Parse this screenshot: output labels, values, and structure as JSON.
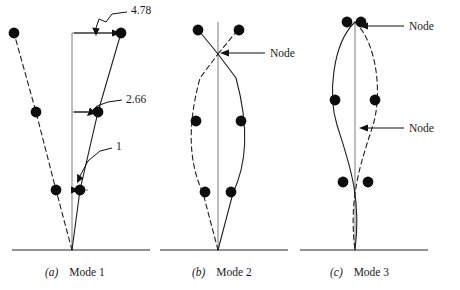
{
  "figure": {
    "type": "engineering-diagram",
    "panels": [
      {
        "id": "a",
        "letter": "(a)",
        "label": "Mode 1",
        "caption": "(a)   Mode 1",
        "amplitudes": [
          "1",
          "2.66",
          "4.78"
        ],
        "annotations": [
          {
            "name": "top-amplitude",
            "text": "4.78"
          },
          {
            "name": "middle-amplitude",
            "text": "2.66"
          },
          {
            "name": "bottom-amplitude",
            "text": "1"
          }
        ],
        "nodes": []
      },
      {
        "id": "b",
        "letter": "(b)",
        "label": "Mode 2",
        "caption": "(b)   Mode 2",
        "amplitudes": [],
        "annotations": [],
        "nodes": [
          {
            "name": "node-upper",
            "text": "Node"
          }
        ]
      },
      {
        "id": "c",
        "letter": "(c)",
        "label": "Mode 3",
        "caption": "(c)   Mode 3",
        "amplitudes": [],
        "annotations": [],
        "nodes": [
          {
            "name": "node-upper",
            "text": "Node"
          },
          {
            "name": "node-lower",
            "text": "Node"
          }
        ]
      }
    ],
    "colors": {
      "ink": "#1a1a1a",
      "line": "#2b2b2b",
      "reference_frame": "#6f6f6f",
      "ground": "#6f6f6f",
      "background": "#ffffff"
    }
  }
}
